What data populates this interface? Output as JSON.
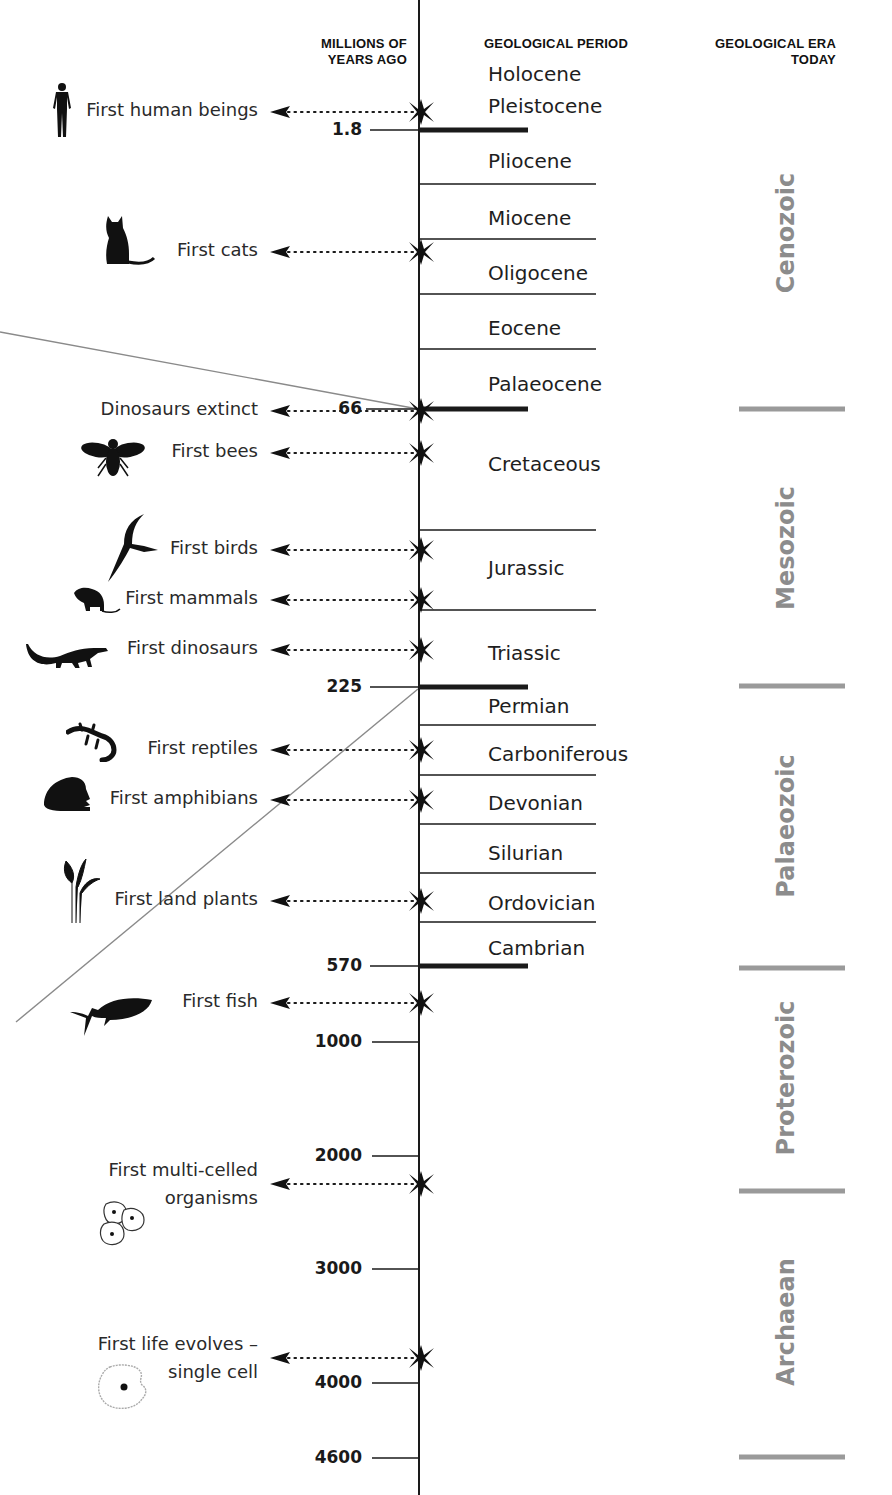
{
  "headers": {
    "millions": "MILLIONS OF\nYEARS AGO",
    "millions_line1": "MILLIONS OF",
    "millions_line2": "YEARS AGO",
    "period": "GEOLOGICAL PERIOD",
    "era_line1": "GEOLOGICAL ERA",
    "era_line2": "TODAY"
  },
  "colors": {
    "axis": "#1a1a1a",
    "era_text": "#8c8c8c",
    "era_divider": "#9a9a9a",
    "guide_line": "#8a8a8a"
  },
  "ticks": [
    {
      "label": "1.8",
      "y": 130,
      "major": true
    },
    {
      "label": "66",
      "y": 409,
      "major": true
    },
    {
      "label": "225",
      "y": 687,
      "major": true
    },
    {
      "label": "570",
      "y": 966,
      "major": true
    },
    {
      "label": "1000",
      "y": 1042,
      "major": false
    },
    {
      "label": "2000",
      "y": 1156,
      "major": false
    },
    {
      "label": "3000",
      "y": 1269,
      "major": false
    },
    {
      "label": "4000",
      "y": 1383,
      "major": false
    },
    {
      "label": "4600",
      "y": 1458,
      "major": false
    }
  ],
  "periods": [
    {
      "name": "Holocene",
      "y": 75
    },
    {
      "name": "Pleistocene",
      "y": 107
    },
    {
      "name": "Pliocene",
      "y": 162
    },
    {
      "name": "Miocene",
      "y": 219
    },
    {
      "name": "Oligocene",
      "y": 274
    },
    {
      "name": "Eocene",
      "y": 329
    },
    {
      "name": "Palaeocene",
      "y": 385
    },
    {
      "name": "Cretaceous",
      "y": 465
    },
    {
      "name": "Jurassic",
      "y": 569
    },
    {
      "name": "Triassic",
      "y": 654
    },
    {
      "name": "Permian",
      "y": 707
    },
    {
      "name": "Carboniferous",
      "y": 755
    },
    {
      "name": "Devonian",
      "y": 804
    },
    {
      "name": "Silurian",
      "y": 854
    },
    {
      "name": "Ordovician",
      "y": 904
    },
    {
      "name": "Cambrian",
      "y": 949
    }
  ],
  "period_dividers": [
    184,
    239,
    294,
    349,
    530,
    610,
    725,
    775,
    824,
    873,
    922
  ],
  "eras": [
    {
      "name": "Cenozoic",
      "y_center": 233
    },
    {
      "name": "Mesozoic",
      "y_center": 548
    },
    {
      "name": "Palaeozoic",
      "y_center": 826
    },
    {
      "name": "Proterozoic",
      "y_center": 1078
    },
    {
      "name": "Archaean",
      "y_center": 1322
    }
  ],
  "era_dividers": [
    409,
    686,
    968,
    1191,
    1457
  ],
  "events": [
    {
      "label": "First human beings",
      "y": 112,
      "icon": "human-icon"
    },
    {
      "label": "First cats",
      "y": 252,
      "icon": "cat-icon"
    },
    {
      "label": "Dinosaurs extinct",
      "y": 411,
      "icon": ""
    },
    {
      "label": "First bees",
      "y": 453,
      "icon": "bee-icon"
    },
    {
      "label": "First birds",
      "y": 550,
      "icon": "bird-icon"
    },
    {
      "label": "First mammals",
      "y": 600,
      "icon": "rat-icon"
    },
    {
      "label": "First dinosaurs",
      "y": 650,
      "icon": "dinosaur-icon"
    },
    {
      "label": "First reptiles",
      "y": 750,
      "icon": "lizard-icon"
    },
    {
      "label": "First amphibians",
      "y": 800,
      "icon": "frog-icon"
    },
    {
      "label": "First land plants",
      "y": 901,
      "icon": "plant-icon"
    },
    {
      "label": "First fish",
      "y": 1003,
      "icon": "fish-icon"
    },
    {
      "label": "First multi-celled\norganisms",
      "line1": "First multi-celled",
      "line2": "organisms",
      "y": 1184,
      "icon": "multi-cell-icon"
    },
    {
      "label": "First life evolves –\nsingle cell",
      "line1": "First life evolves –",
      "line2": "single cell",
      "y": 1358,
      "icon": "single-cell-icon"
    }
  ]
}
